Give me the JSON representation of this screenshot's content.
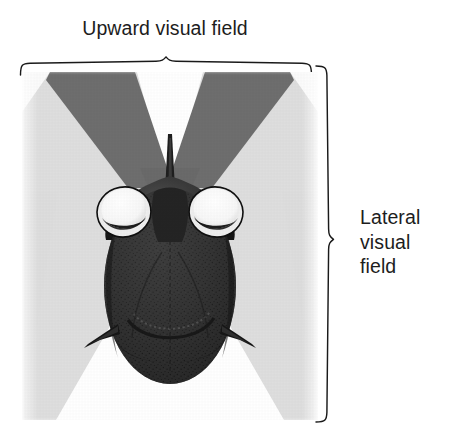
{
  "figure": {
    "top_label": "Upward visual field",
    "right_label": {
      "line1": "Lateral",
      "line2": "visual",
      "line3": "field"
    }
  },
  "icons": {
    "bracket_top": "curly-brace-top-icon",
    "bracket_right": "curly-brace-right-icon"
  },
  "colors": {
    "ink": "#1a1a1a",
    "text": "#1d1d1d",
    "page_background": "#ffffff",
    "plate_background": "#fdfdfd",
    "upward_field_dark_gray": "#6e6e6e",
    "lateral_field_light_gray": "#dedede",
    "white_wedge": "#ffffff",
    "fish_body_dark": "#2e2e2e",
    "fish_body_mid": "#3c3c3c",
    "fish_body_shadow": "#1c1c1c",
    "eye_white": "#fbfbfb",
    "eye_ring": "#f2f2f2",
    "pupil": "#262626"
  },
  "diagram": {
    "features": [
      {
        "name": "dorsal-spine",
        "label": "dorsal spine"
      },
      {
        "name": "left-eye",
        "label": "left eye"
      },
      {
        "name": "right-eye",
        "label": "right eye"
      },
      {
        "name": "left-pectoral-fin",
        "label": "left pectoral fin"
      },
      {
        "name": "right-pectoral-fin",
        "label": "right pectoral fin"
      },
      {
        "name": "mouth",
        "label": "mouth"
      }
    ],
    "fields": [
      {
        "name": "upward-visual-field",
        "shade": "dark gray",
        "shape": "V opening upward above the head"
      },
      {
        "name": "lateral-visual-field",
        "shade": "light gray",
        "shape": "wedges opening downward to each side"
      }
    ]
  }
}
